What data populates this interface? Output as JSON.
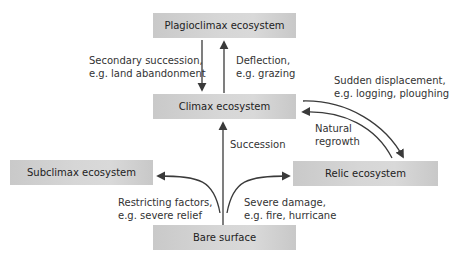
{
  "nodes": {
    "plagioclimax": "Plagioclimax ecosystem",
    "climax": "Climax ecosystem",
    "subclimax": "Subclimax ecosystem",
    "relic": "Relic ecosystem",
    "bare": "Bare surface"
  },
  "edges": {
    "secondary_line1": "Secondary succession,",
    "secondary_line2": "e.g. land abandonment",
    "deflection_line1": "Deflection,",
    "deflection_line2": "e.g. grazing",
    "sudden_line1": "Sudden displacement,",
    "sudden_line2": "e.g. logging, ploughing",
    "natural_line1": "Natural",
    "natural_line2": "regrowth",
    "succession": "Succession",
    "restricting_line1": "Restricting factors,",
    "restricting_line2": "e.g. severe relief",
    "severe_line1": "Severe damage,",
    "severe_line2": "e.g. fire, hurricane"
  },
  "colors": {
    "box_fill": "#d4d4d4",
    "arrow": "#3a3a3a"
  }
}
